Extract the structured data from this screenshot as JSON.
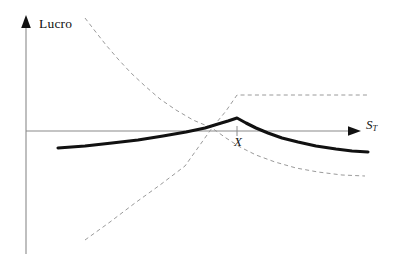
{
  "figure": {
    "title": "",
    "background_color": "#ffffff",
    "width": 399,
    "height": 266
  },
  "labels": {
    "y_axis": "Lucro",
    "x_axis_symbol": "S",
    "x_axis_subscript": "T",
    "strike": "X"
  },
  "colors": {
    "axis": "#8a8a8a",
    "axis_arrow": "#111111",
    "net_curve": "#111111",
    "component_curve": "#9a9a9a",
    "text": "#111111"
  },
  "chart_data": {
    "type": "line",
    "title": "",
    "subtitle": "",
    "xlabel": "S_T",
    "ylabel": "Lucro",
    "xlim": [
      0,
      399
    ],
    "ylim": [
      266,
      0
    ],
    "grid": false,
    "legend_position": "none",
    "annotations": [
      {
        "text": "Lucro",
        "x": 39,
        "y": 24,
        "role": "y-axis-label"
      },
      {
        "text": "S_T",
        "x": 366,
        "y": 126,
        "role": "x-axis-label"
      },
      {
        "text": "X",
        "x": 238,
        "y": 143,
        "role": "strike-marker-label"
      }
    ],
    "axes": {
      "y_axis": {
        "x": 26,
        "y_top": 18,
        "y_bottom": 254,
        "arrow": "up"
      },
      "x_axis": {
        "y": 131,
        "x_left": 26,
        "x_right": 360,
        "arrow": "right"
      },
      "strike_tick": {
        "x": 237,
        "y_from": 126,
        "y_to": 136,
        "label": "X"
      }
    },
    "series": [
      {
        "name": "Lucro total da estrategia",
        "style": "solid",
        "width": 3.1,
        "color": "#111111",
        "points": [
          [
            58,
            148
          ],
          [
            85,
            146
          ],
          [
            112,
            143
          ],
          [
            138,
            140
          ],
          [
            163,
            136
          ],
          [
            186,
            132
          ],
          [
            205,
            128
          ],
          [
            218,
            124
          ],
          [
            228,
            121
          ],
          [
            237,
            118
          ],
          [
            246,
            123
          ],
          [
            256,
            128
          ],
          [
            268,
            133
          ],
          [
            282,
            138
          ],
          [
            298,
            142
          ],
          [
            316,
            146
          ],
          [
            336,
            149
          ],
          [
            352,
            151
          ],
          [
            368,
            152
          ]
        ]
      },
      {
        "name": "Componente decrescente convexa",
        "style": "dashed",
        "width": 1,
        "color": "#9a9a9a",
        "points": [
          [
            85,
            18
          ],
          [
            95,
            31
          ],
          [
            106,
            45
          ],
          [
            118,
            59
          ],
          [
            131,
            73
          ],
          [
            145,
            86
          ],
          [
            160,
            99
          ],
          [
            176,
            110
          ],
          [
            193,
            120
          ],
          [
            212,
            128
          ],
          [
            226,
            138
          ],
          [
            240,
            147
          ],
          [
            256,
            155
          ],
          [
            275,
            162
          ],
          [
            296,
            168
          ],
          [
            318,
            172
          ],
          [
            342,
            175
          ],
          [
            365,
            176
          ]
        ]
      },
      {
        "name": "Componente crescente com patamar",
        "style": "dashed",
        "width": 1,
        "color": "#9a9a9a",
        "points": [
          [
            85,
            240
          ],
          [
            110,
            222
          ],
          [
            135,
            203
          ],
          [
            160,
            185
          ],
          [
            185,
            166
          ],
          [
            212,
            128
          ],
          [
            226,
            111
          ],
          [
            237,
            95
          ],
          [
            262,
            95
          ],
          [
            290,
            95
          ],
          [
            320,
            95
          ],
          [
            348,
            95
          ],
          [
            370,
            95
          ]
        ]
      }
    ]
  }
}
